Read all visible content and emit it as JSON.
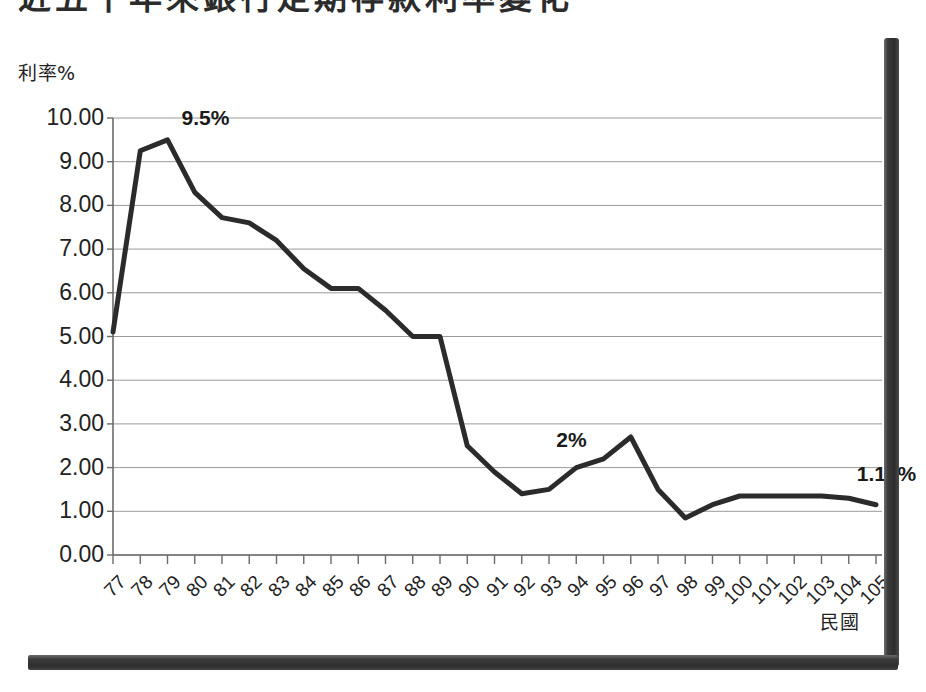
{
  "page": {
    "title_partial": "近五十年來銀行定期存款利率變化",
    "background_color": "#ffffff",
    "frame_color": "#2e2e2e"
  },
  "chart_data": {
    "type": "line",
    "title": "近五十年來銀行定期存款利率變化",
    "xlabel": "民國",
    "ylabel": "利率%",
    "ylim": [
      0,
      10
    ],
    "ytick_labels": [
      "10.00",
      "9.00",
      "8.00",
      "7.00",
      "6.00",
      "5.00",
      "4.00",
      "3.00",
      "2.00",
      "1.00",
      "0.00"
    ],
    "ytick_values": [
      10,
      9,
      8,
      7,
      6,
      5,
      4,
      3,
      2,
      1,
      0
    ],
    "grid": true,
    "legend": "none",
    "line_color": "#2b2b2b",
    "line_width": 5,
    "categories": [
      "77",
      "78",
      "79",
      "80",
      "81",
      "82",
      "83",
      "84",
      "85",
      "86",
      "87",
      "88",
      "89",
      "90",
      "91",
      "92",
      "93",
      "94",
      "95",
      "96",
      "97",
      "98",
      "99",
      "100",
      "101",
      "102",
      "103",
      "104",
      "105"
    ],
    "values": [
      5.1,
      9.25,
      9.5,
      8.3,
      7.72,
      7.6,
      7.2,
      6.55,
      6.1,
      6.1,
      5.6,
      5.0,
      5.0,
      2.5,
      1.9,
      1.4,
      1.5,
      2.0,
      2.2,
      2.7,
      1.5,
      0.85,
      1.15,
      1.35,
      1.35,
      1.35,
      1.35,
      1.3,
      1.15
    ],
    "annotations": [
      {
        "label": "9.5%",
        "category": "79",
        "value": 9.5
      },
      {
        "label": "2%",
        "category": "94",
        "value": 2.0
      },
      {
        "label": "1.15%",
        "category": "104",
        "value": 1.3
      }
    ]
  }
}
